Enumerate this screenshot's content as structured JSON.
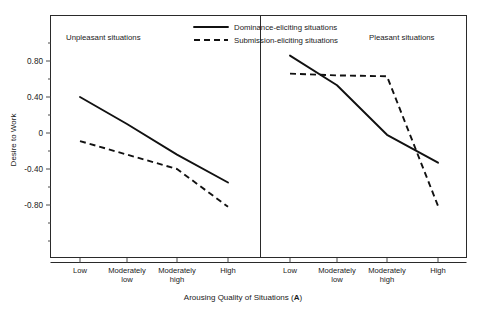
{
  "chart_data": {
    "type": "line",
    "title": "",
    "xlabel": "Arousing Quality of Situations (A)",
    "ylabel": "Desire to Work",
    "ylim": [
      -1.0,
      1.0
    ],
    "yticks": [
      0.8,
      0.4,
      0,
      -0.4,
      -0.8
    ],
    "ytick_labels": [
      "0.80",
      "0.40",
      "0",
      "-0.40",
      "-0.80"
    ],
    "categories": [
      "Low",
      "Moderately low",
      "Moderately high",
      "High"
    ],
    "grid": false,
    "legend_position": "top-center",
    "legend": [
      {
        "name": "Dominance-eliciting situations",
        "style": "solid"
      },
      {
        "name": "Submission-eliciting situations",
        "style": "dashed"
      }
    ],
    "panels": [
      {
        "label": "Unpleasant situations",
        "series": [
          {
            "name": "Dominance-eliciting situations",
            "style": "solid",
            "values": [
              0.4,
              0.1,
              -0.24,
              -0.55
            ]
          },
          {
            "name": "Submission-eliciting situations",
            "style": "dashed",
            "values": [
              -0.09,
              -0.24,
              -0.4,
              -0.82
            ]
          }
        ]
      },
      {
        "label": "Pleasant situations",
        "series": [
          {
            "name": "Dominance-eliciting situations",
            "style": "solid",
            "values": [
              0.86,
              0.53,
              -0.02,
              -0.33
            ]
          },
          {
            "name": "Submission-eliciting situations",
            "style": "dashed",
            "values": [
              0.66,
              0.64,
              0.63,
              -0.81
            ]
          }
        ]
      }
    ]
  },
  "axis": {
    "y_title": "Desire to Work",
    "x_title_main": "Arousing Quality of Situations (",
    "x_title_symbol": "A",
    "x_title_tail": ")",
    "ytick_0": "0.80",
    "ytick_1": "0.40",
    "ytick_2": "0",
    "ytick_3": "-0.40",
    "ytick_4": "-0.80"
  },
  "categories": {
    "low": "Low",
    "mod_low_line1": "Moderately",
    "mod_low_line2": "low",
    "mod_high_line1": "Moderately",
    "mod_high_line2": "high",
    "high": "High"
  },
  "panels": {
    "left_label": "Unpleasant situations",
    "right_label": "Pleasant situations"
  },
  "legend": {
    "solid_label": "Dominance-eliciting situations",
    "dashed_label": "Submission-eliciting situations"
  },
  "colors": {
    "line": "#111111",
    "frame": "#2a2a2a",
    "background": "#ffffff"
  }
}
